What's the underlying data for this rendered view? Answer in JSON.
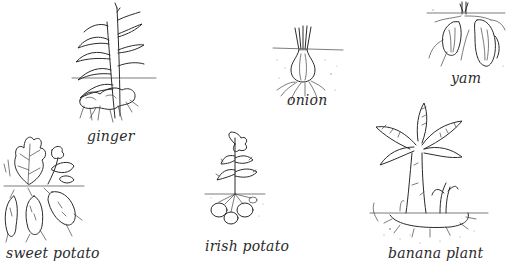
{
  "diagram": {
    "title": "",
    "plants": [
      {
        "id": "ginger",
        "label": "ginger"
      },
      {
        "id": "onion",
        "label": "onion"
      },
      {
        "id": "yam",
        "label": "yam"
      },
      {
        "id": "sweet-potato",
        "label": "sweet potato"
      },
      {
        "id": "irish-potato",
        "label": "irish potato"
      },
      {
        "id": "banana-plant",
        "label": "banana plant"
      }
    ],
    "colors": {
      "ink": "#2b2b2b",
      "background": "#ffffff"
    }
  }
}
